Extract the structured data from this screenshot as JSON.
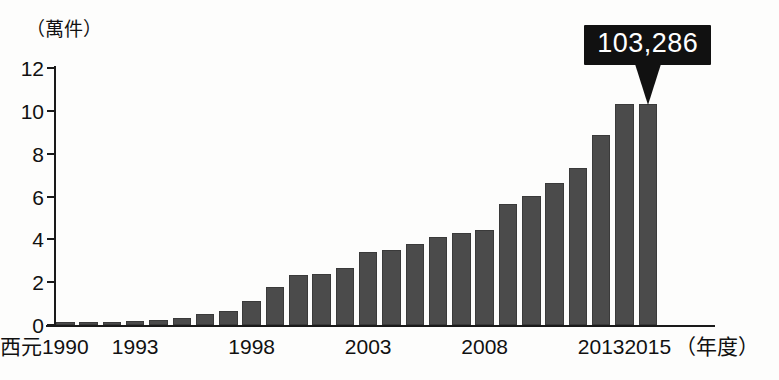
{
  "chart_data": {
    "type": "bar",
    "title": "",
    "subtitle": "",
    "ylabel": "（萬件）",
    "xlabel": "（年度）",
    "x_prefix": "西元",
    "ylim": [
      0,
      12
    ],
    "y_ticks": [
      0,
      2,
      4,
      6,
      8,
      10,
      12
    ],
    "y_tick_labels": [
      "0",
      "2",
      "4",
      "6",
      "8",
      "10",
      "12"
    ],
    "grid": false,
    "legend": null,
    "bar_color": "#4b4b4b",
    "axis_color": "#1a1a1a",
    "categories": [
      "1990",
      "1991",
      "1992",
      "1993",
      "1994",
      "1995",
      "1996",
      "1997",
      "1998",
      "1999",
      "2000",
      "2001",
      "2002",
      "2003",
      "2004",
      "2005",
      "2006",
      "2007",
      "2008",
      "2009",
      "2010",
      "2011",
      "2012",
      "2013",
      "2014",
      "2015"
    ],
    "values": [
      0.12,
      0.13,
      0.15,
      0.18,
      0.22,
      0.34,
      0.52,
      0.66,
      1.14,
      1.76,
      2.33,
      2.4,
      2.66,
      3.42,
      3.48,
      3.76,
      4.12,
      4.28,
      4.44,
      5.63,
      6.03,
      6.64,
      7.33,
      8.87,
      10.33,
      10.33
    ],
    "x_tick_labels": [
      {
        "label": "1990",
        "category": "1990"
      },
      {
        "label": "1993",
        "category": "1993"
      },
      {
        "label": "1998",
        "category": "1998"
      },
      {
        "label": "2003",
        "category": "2003"
      },
      {
        "label": "2008",
        "category": "2008"
      },
      {
        "label": "2013",
        "category": "2013"
      },
      {
        "label": "2015",
        "category": "2015"
      }
    ],
    "annotations": [
      {
        "text": "103,286",
        "target_category": "2015",
        "style": "black-callout-with-pointer"
      }
    ]
  },
  "callout": {
    "value_label": "103,286"
  },
  "axis": {
    "unit_caption": "（萬件）",
    "x_unit_caption": "（年度）",
    "x_prefix": "西元"
  }
}
